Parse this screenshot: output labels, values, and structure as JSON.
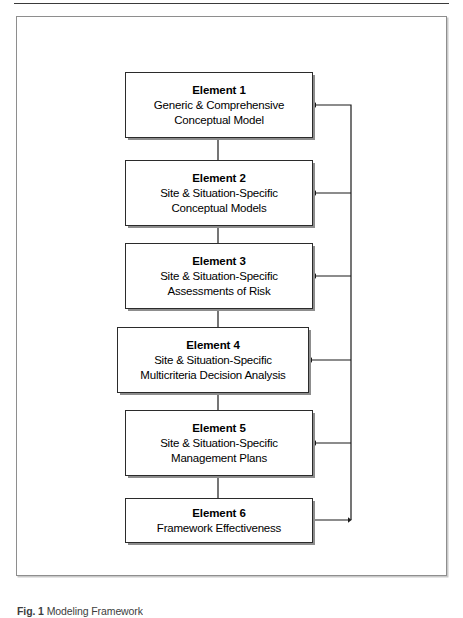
{
  "figure": {
    "caption_label": "Fig. 1",
    "caption_text": "Modeling Framework",
    "top_rule": "horizontal-rule"
  },
  "diagram": {
    "type": "flowchart",
    "orientation": "top-to-bottom",
    "boxes": [
      {
        "id": "element-1",
        "title": "Element 1",
        "lines": [
          "Generic & Comprehensive",
          "Conceptual Model"
        ],
        "width_variant": "narrow"
      },
      {
        "id": "element-2",
        "title": "Element 2",
        "lines": [
          "Site & Situation-Specific",
          "Conceptual Models"
        ],
        "width_variant": "narrow"
      },
      {
        "id": "element-3",
        "title": "Element 3",
        "lines": [
          "Site & Situation-Specific",
          "Assessments of Risk"
        ],
        "width_variant": "narrow"
      },
      {
        "id": "element-4",
        "title": "Element 4",
        "lines": [
          "Site & Situation-Specific",
          "Multicriteria Decision Analysis"
        ],
        "width_variant": "wide"
      },
      {
        "id": "element-5",
        "title": "Element 5",
        "lines": [
          "Site & Situation-Specific",
          "Management Plans"
        ],
        "width_variant": "narrow"
      },
      {
        "id": "element-6",
        "title": "Element 6",
        "lines": [
          "Framework Effectiveness"
        ],
        "width_variant": "wide"
      }
    ],
    "connectors": {
      "forward_label": "sequential-down-arrow",
      "feedback_label": "feedback-return-arrow",
      "forward_count": 5,
      "feedback_count": 5
    },
    "colors": {
      "box_border": "#2b2b2b",
      "box_fill": "#ffffff",
      "box_shadow": "#8d8d8d",
      "frame_border": "#8e8e8e",
      "connector": "#1a1a1a",
      "text": "#000000"
    }
  }
}
